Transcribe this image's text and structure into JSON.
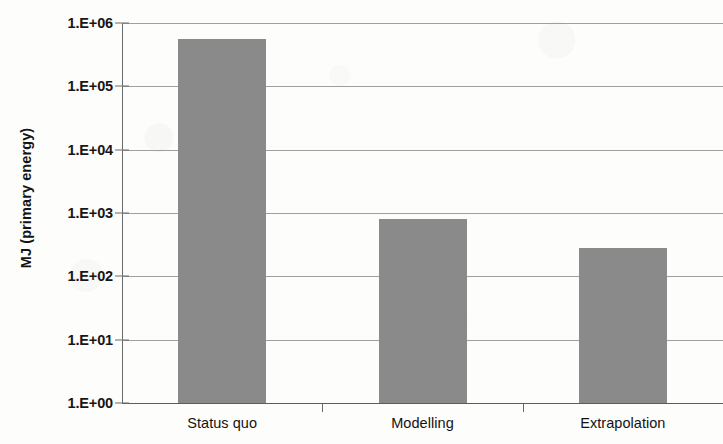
{
  "chart_data": {
    "type": "bar",
    "title": "",
    "xlabel": "",
    "ylabel": "MJ (primary energy)",
    "categories": [
      "Status quo",
      "Modelling",
      "Extrapolation"
    ],
    "values": [
      550000,
      810,
      280
    ],
    "series": [
      {
        "name": "MJ (primary energy)",
        "values": [
          550000,
          810,
          280
        ]
      }
    ],
    "yscale": "log",
    "ylim": [
      1,
      1000000
    ],
    "ytick_values": [
      1,
      10,
      100,
      1000,
      10000,
      100000,
      1000000
    ],
    "ytick_labels": [
      "1.E+00",
      "1.E+01",
      "1.E+02",
      "1.E+03",
      "1.E+04",
      "1.E+05",
      "1.E+06"
    ],
    "grid": true,
    "grid_axis": "y",
    "legend": false,
    "legend_position": "none",
    "bar_color": "#8a8a8a",
    "grid_color": "#8e8e8e",
    "axis_color": "#6a6a6a",
    "background_color": "#fdfdfc",
    "text_color": "#141414"
  },
  "axis": {
    "y_title": "MJ (primary energy)"
  }
}
